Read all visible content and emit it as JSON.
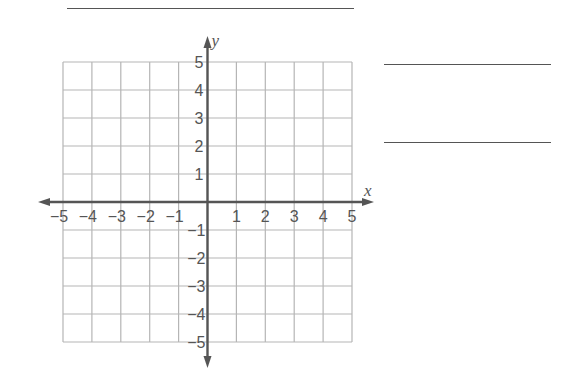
{
  "title_line": {
    "x1": 67,
    "x2": 354,
    "y": 8
  },
  "answer_lines": [
    {
      "x1": 384,
      "x2": 551,
      "y": 64
    },
    {
      "x1": 384,
      "x2": 551,
      "y": 142
    }
  ],
  "grid": {
    "x_range": [
      -5,
      5
    ],
    "y_range": [
      -5,
      5
    ],
    "left": 63,
    "top": 62,
    "right": 352,
    "bottom": 342,
    "grid_color": "#b5b5b5",
    "axis_color": "#555555"
  },
  "axes": {
    "x_label": "x",
    "y_label": "y",
    "x_ticks": [
      "−5",
      "−4",
      "−3",
      "−2",
      "−1",
      "1",
      "2",
      "3",
      "4",
      "5"
    ],
    "y_ticks_positive": [
      "5",
      "4",
      "3",
      "2",
      "1"
    ],
    "y_ticks_negative": [
      "−1",
      "−2",
      "−3",
      "−4",
      "−5"
    ]
  },
  "chart_data": {
    "type": "scatter",
    "title": "",
    "xlabel": "x",
    "ylabel": "y",
    "xlim": [
      -5,
      5
    ],
    "ylim": [
      -5,
      5
    ],
    "grid": true,
    "x_ticks": [
      -5,
      -4,
      -3,
      -2,
      -1,
      1,
      2,
      3,
      4,
      5
    ],
    "y_ticks": [
      -5,
      -4,
      -3,
      -2,
      -1,
      1,
      2,
      3,
      4,
      5
    ],
    "series": []
  }
}
